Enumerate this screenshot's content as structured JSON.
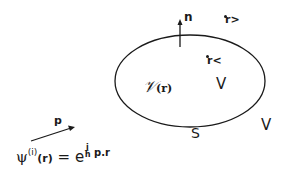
{
  "diagram": {
    "type": "scattering-region-schematic",
    "region": {
      "shape": "ellipse",
      "interior_label": "V",
      "boundary_label": "S",
      "exterior_label": "Ṽ",
      "potential_label": "𝒱",
      "potential_arg": "(r)"
    },
    "normal": {
      "label": "n"
    },
    "points": [
      {
        "label": "r",
        "subscript": ">",
        "position": "outside"
      },
      {
        "label": "r",
        "subscript": "<",
        "position": "inside"
      }
    ],
    "incident_wave": {
      "momentum_label": "p",
      "lhs": "ψ",
      "superscript": "(i)",
      "arg": "(r)",
      "equals": "=",
      "base": "e",
      "exp_num": "i",
      "exp_den": "ħ",
      "exp_rest": "p.r"
    },
    "colors": {
      "stroke": "#1a1a1a",
      "background": "#ffffff"
    }
  }
}
